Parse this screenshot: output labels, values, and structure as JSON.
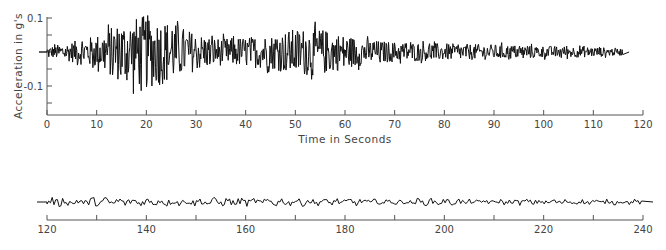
{
  "chart_data": [
    {
      "type": "line",
      "title": "",
      "xlabel": "Time in Seconds",
      "ylabel": "Acceleration in g's",
      "xlim": [
        0,
        120
      ],
      "ylim": [
        -0.15,
        0.1
      ],
      "grid": false,
      "legend": null,
      "x_ticks": [
        0,
        10,
        20,
        30,
        40,
        50,
        60,
        70,
        80,
        90,
        100,
        110,
        120
      ],
      "x_tick_labels": [
        "0",
        "10",
        "20",
        "30",
        "40",
        "50",
        "60",
        "70",
        "80",
        "90",
        "100",
        "110",
        "120"
      ],
      "y_ticks": [
        0.1,
        0.05,
        0,
        -0.05,
        -0.1,
        -0.15
      ],
      "y_tick_labels": [
        "0.1",
        "",
        "",
        "",
        "-0.1",
        ""
      ],
      "series": [
        {
          "name": "acceleration record (0-120 s)",
          "envelope": {
            "x": [
              0,
              5,
              10,
              15,
              20,
              25,
              30,
              35,
              40,
              45,
              50,
              55,
              60,
              65,
              70,
              80,
              90,
              100,
              110,
              116
            ],
            "amplitude": [
              0.015,
              0.03,
              0.05,
              0.09,
              0.11,
              0.09,
              0.055,
              0.04,
              0.045,
              0.05,
              0.07,
              0.07,
              0.05,
              0.035,
              0.03,
              0.025,
              0.022,
              0.018,
              0.015,
              0.01
            ]
          },
          "peak_positive": {
            "x": 20,
            "y": 0.105
          },
          "peak_negative": {
            "x": 17,
            "y": -0.135
          }
        }
      ]
    },
    {
      "type": "line",
      "title": "",
      "xlabel": "",
      "ylabel": "",
      "xlim": [
        120,
        240
      ],
      "grid": false,
      "x_ticks": [
        120,
        130,
        140,
        150,
        160,
        170,
        180,
        190,
        200,
        210,
        220,
        230,
        240
      ],
      "x_tick_labels": [
        "120",
        "",
        "140",
        "",
        "160",
        "",
        "180",
        "",
        "200",
        "",
        "220",
        "",
        "240"
      ],
      "series": [
        {
          "name": "acceleration record (120-240 s)",
          "envelope": {
            "x": [
              120,
              140,
              160,
              180,
              200,
              220,
              240
            ],
            "amplitude": [
              0.012,
              0.01,
              0.01,
              0.009,
              0.008,
              0.007,
              0.006
            ]
          }
        }
      ]
    }
  ],
  "labels": {
    "ylabel": "Acceleration in g's",
    "xlabel": "Time in Seconds"
  }
}
